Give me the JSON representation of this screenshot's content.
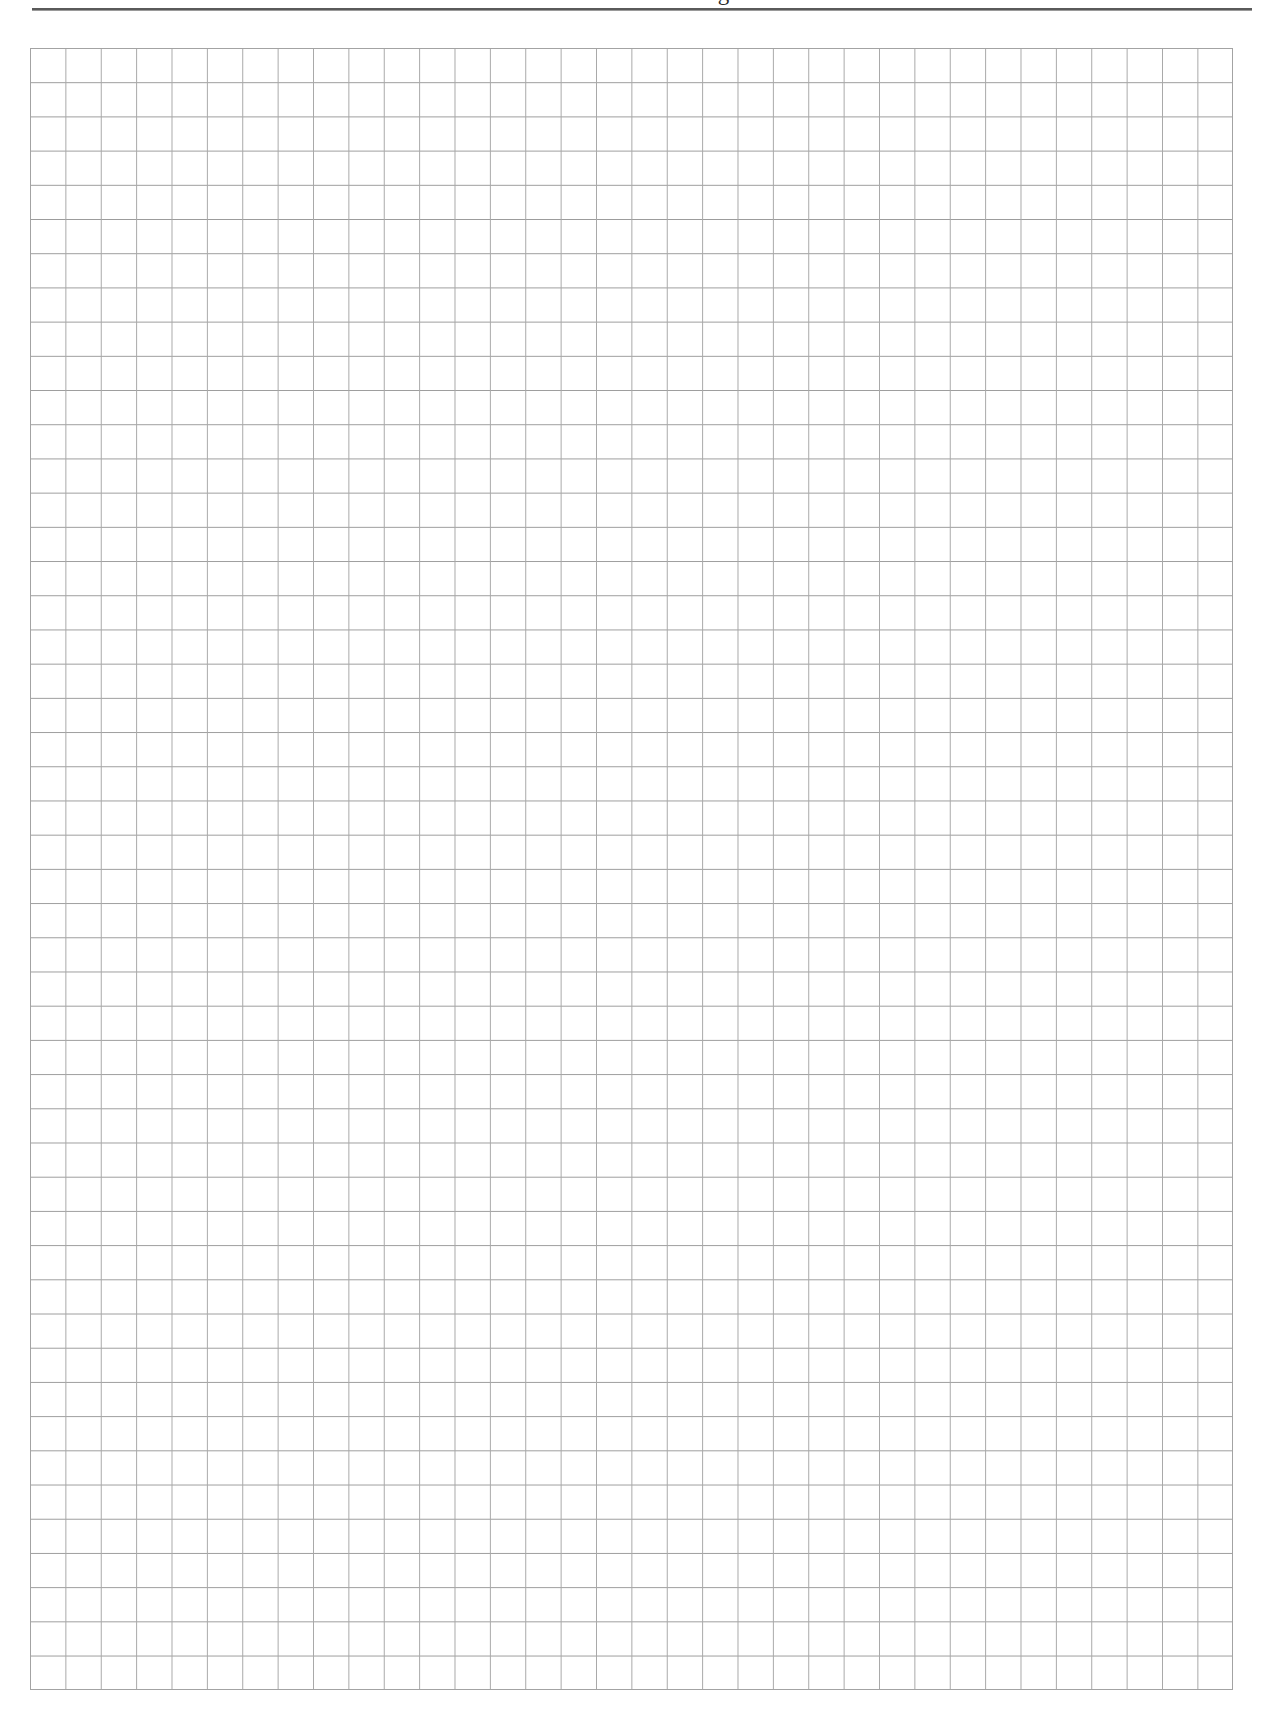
{
  "header": {
    "title": "Protists and Fungi"
  },
  "grid": {
    "columns": 34,
    "rows": 48,
    "line_color": "#a3a3a3",
    "rule_color": "#5a5a5a"
  }
}
